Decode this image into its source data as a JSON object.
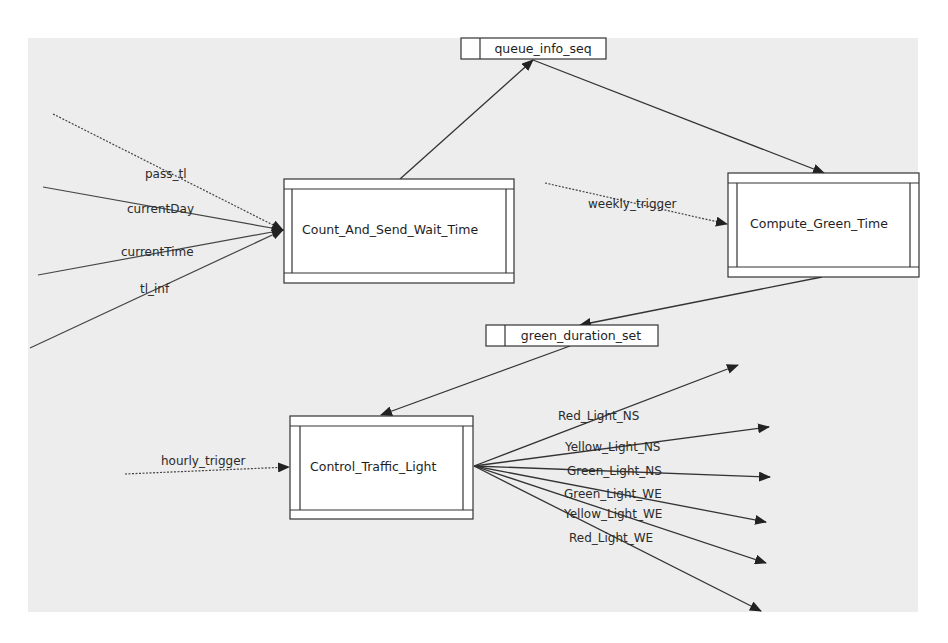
{
  "diagram": {
    "type": "data-flow-diagram",
    "colors": {
      "background": "#ededed",
      "line": "#333333",
      "box_fill": "#ffffff"
    },
    "processes": [
      {
        "id": "count",
        "label": "Count_And_Send_Wait_Time"
      },
      {
        "id": "compute",
        "label": "Compute_Green_Time"
      },
      {
        "id": "control",
        "label": "Control_Traffic_Light"
      }
    ],
    "stores": [
      {
        "id": "queue",
        "label": "queue_info_seq"
      },
      {
        "id": "green",
        "label": "green_duration_set"
      }
    ],
    "inputs": {
      "pass_tl": "pass_tl",
      "currentDay": "currentDay",
      "currentTime": "currentTime",
      "tl_inf": "tl_inf",
      "weekly_trigger": "weekly_trigger",
      "hourly_trigger": "hourly_trigger"
    },
    "outputs": [
      "Red_Light_NS",
      "Yellow_Light_NS",
      "Green_Light_NS",
      "Green_Light_WE",
      "Yellow_Light_WE",
      "Red_Light_WE"
    ],
    "flows": [
      {
        "from": "external",
        "to": "count",
        "label": "pass_tl",
        "style": "dashed"
      },
      {
        "from": "external",
        "to": "count",
        "label": "currentDay",
        "style": "solid"
      },
      {
        "from": "external",
        "to": "count",
        "label": "currentTime",
        "style": "solid"
      },
      {
        "from": "external",
        "to": "count",
        "label": "tl_inf",
        "style": "solid"
      },
      {
        "from": "count",
        "to": "queue",
        "label": "",
        "style": "solid"
      },
      {
        "from": "queue",
        "to": "compute",
        "label": "",
        "style": "solid"
      },
      {
        "from": "external",
        "to": "compute",
        "label": "weekly_trigger",
        "style": "dashed"
      },
      {
        "from": "compute",
        "to": "green",
        "label": "",
        "style": "solid"
      },
      {
        "from": "green",
        "to": "control",
        "label": "",
        "style": "solid"
      },
      {
        "from": "external",
        "to": "control",
        "label": "hourly_trigger",
        "style": "dashed"
      },
      {
        "from": "control",
        "to": "external",
        "label": "Red_Light_NS",
        "style": "solid"
      },
      {
        "from": "control",
        "to": "external",
        "label": "Yellow_Light_NS",
        "style": "solid"
      },
      {
        "from": "control",
        "to": "external",
        "label": "Green_Light_NS",
        "style": "solid"
      },
      {
        "from": "control",
        "to": "external",
        "label": "Green_Light_WE",
        "style": "solid"
      },
      {
        "from": "control",
        "to": "external",
        "label": "Yellow_Light_WE",
        "style": "solid"
      },
      {
        "from": "control",
        "to": "external",
        "label": "Red_Light_WE",
        "style": "solid"
      }
    ]
  }
}
